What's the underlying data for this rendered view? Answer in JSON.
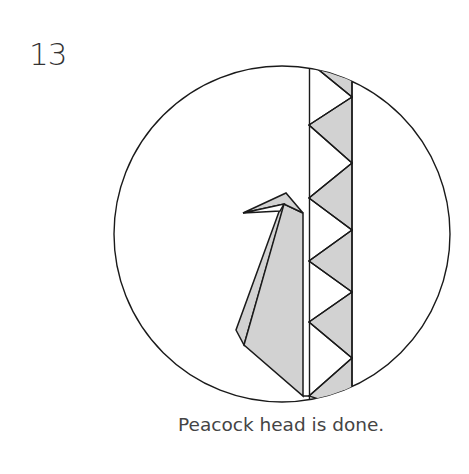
{
  "step": {
    "number": "13"
  },
  "caption": {
    "text": "Peacock head is done."
  },
  "colors": {
    "line": "#1a1a1a",
    "fill": "#d2d2d2",
    "background": "#ffffff",
    "text": "#444444"
  },
  "diagram": {
    "circle": {
      "cx": 282,
      "cy": 234,
      "r": 168
    }
  }
}
